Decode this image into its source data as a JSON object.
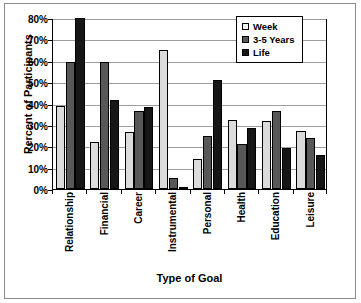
{
  "chart_data": {
    "type": "bar",
    "title": "",
    "xlabel": "Type of Goal",
    "ylabel": "Percent of Participants",
    "categories": [
      "Relationship",
      "Financial",
      "Career",
      "Instrumental",
      "Personal",
      "Health",
      "Education",
      "Leisure"
    ],
    "series": [
      {
        "name": "Week",
        "color": "#dcdcdc",
        "values": [
          39,
          22,
          26.5,
          65,
          14,
          32.5,
          32,
          27
        ]
      },
      {
        "name": "3-5 Years",
        "color": "#585858",
        "values": [
          59.5,
          59.5,
          36.5,
          5,
          25,
          21,
          36.5,
          24
        ]
      },
      {
        "name": "Life",
        "color": "#161616",
        "values": [
          80,
          41.5,
          38.5,
          0.7,
          51,
          28.5,
          19,
          16
        ]
      }
    ],
    "ylim": [
      0,
      80
    ],
    "ytick_values": [
      0,
      10,
      20,
      30,
      40,
      50,
      60,
      70,
      80
    ],
    "ytick_labels": [
      "0%",
      "10%",
      "20%",
      "30%",
      "40%",
      "50%",
      "60%",
      "70%",
      "80%"
    ],
    "grid": true,
    "grid_axis": "y",
    "legend_position": "top-right",
    "legend_entries": [
      "Week",
      "3-5 Years",
      "Life"
    ]
  }
}
